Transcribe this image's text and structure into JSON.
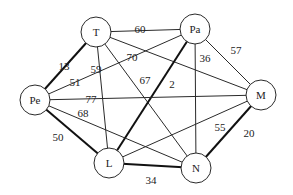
{
  "diagram": {
    "type": "weighted-undirected-graph",
    "nodes": [
      {
        "id": "T",
        "label": "T",
        "x": 96,
        "y": 32,
        "r": 15
      },
      {
        "id": "Pa",
        "label": "Pa",
        "x": 195,
        "y": 29,
        "r": 15
      },
      {
        "id": "Pe",
        "label": "Pe",
        "x": 35,
        "y": 100,
        "r": 15
      },
      {
        "id": "M",
        "label": "M",
        "x": 261,
        "y": 95,
        "r": 15
      },
      {
        "id": "L",
        "label": "L",
        "x": 109,
        "y": 163,
        "r": 15
      },
      {
        "id": "N",
        "label": "N",
        "x": 196,
        "y": 168,
        "r": 15
      }
    ],
    "edges": [
      {
        "from": "T",
        "to": "Pa",
        "weight": "60",
        "bold": false,
        "lx": 140,
        "ly": 29
      },
      {
        "from": "T",
        "to": "Pe",
        "weight": "13",
        "bold": true,
        "lx": 64,
        "ly": 66
      },
      {
        "from": "T",
        "to": "L",
        "weight": "59",
        "bold": false,
        "lx": 96,
        "ly": 69
      },
      {
        "from": "T",
        "to": "M",
        "weight": "70",
        "bold": false,
        "lx": 132,
        "ly": 57
      },
      {
        "from": "T",
        "to": "N",
        "weight": "67",
        "bold": false,
        "lx": 145,
        "ly": 80
      },
      {
        "from": "Pa",
        "to": "Pe",
        "weight": "51",
        "bold": false,
        "lx": 75,
        "ly": 82
      },
      {
        "from": "Pa",
        "to": "L",
        "weight": "2",
        "bold": true,
        "lx": 172,
        "ly": 84
      },
      {
        "from": "Pa",
        "to": "N",
        "weight": "36",
        "bold": false,
        "lx": 205,
        "ly": 58
      },
      {
        "from": "Pa",
        "to": "M",
        "weight": "57",
        "bold": false,
        "lx": 236,
        "ly": 50
      },
      {
        "from": "Pe",
        "to": "M",
        "weight": "77",
        "bold": false,
        "lx": 91,
        "ly": 99
      },
      {
        "from": "Pe",
        "to": "N",
        "weight": "68",
        "bold": false,
        "lx": 83,
        "ly": 113
      },
      {
        "from": "Pe",
        "to": "L",
        "weight": "50",
        "bold": true,
        "lx": 58,
        "ly": 137
      },
      {
        "from": "L",
        "to": "M",
        "weight": "55",
        "bold": false,
        "lx": 220,
        "ly": 127
      },
      {
        "from": "L",
        "to": "N",
        "weight": "34",
        "bold": true,
        "lx": 151,
        "ly": 180
      },
      {
        "from": "N",
        "to": "M",
        "weight": "20",
        "bold": true,
        "lx": 249,
        "ly": 133
      }
    ]
  },
  "style": {
    "line_color": "#2a2a2a",
    "background": "#ffffff"
  }
}
